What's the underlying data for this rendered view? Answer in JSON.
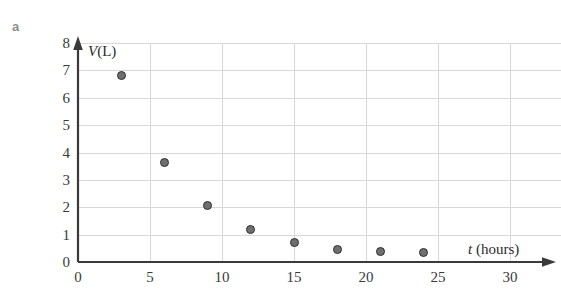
{
  "panel": {
    "label": "a"
  },
  "chart_data": {
    "type": "scatter",
    "title": "",
    "xlabel": "t (hours)",
    "ylabel": "V(L)",
    "xlabel_variable": "t",
    "xlabel_unit": "(hours)",
    "ylabel_variable": "V",
    "ylabel_unit": "(L)",
    "xlim": [
      0,
      30
    ],
    "ylim": [
      0,
      8
    ],
    "xticks": [
      0,
      5,
      10,
      15,
      20,
      25,
      30
    ],
    "xtick_labels": [
      "0",
      "5",
      "10",
      "15",
      "20",
      "25",
      "30"
    ],
    "yticks": [
      0,
      1,
      2,
      3,
      4,
      5,
      6,
      7,
      8
    ],
    "ytick_labels": [
      "0",
      "1",
      "2",
      "3",
      "4",
      "5",
      "6",
      "7",
      "8"
    ],
    "grid": true,
    "grid_x_step": 5,
    "grid_y_step": 1,
    "legend": "none",
    "marker": "filled-circle",
    "marker_color": "#6f6f6f",
    "marker_edge_color": "#2e2e2e",
    "x": [
      3,
      6,
      9,
      12,
      15,
      18,
      21,
      24
    ],
    "y": [
      6.8,
      3.65,
      2.05,
      1.2,
      0.7,
      0.45,
      0.4,
      0.35
    ],
    "points": [
      {
        "t": 3,
        "v": 6.8
      },
      {
        "t": 6,
        "v": 3.65
      },
      {
        "t": 9,
        "v": 2.05
      },
      {
        "t": 12,
        "v": 1.2
      },
      {
        "t": 15,
        "v": 0.7
      },
      {
        "t": 18,
        "v": 0.45
      },
      {
        "t": 21,
        "v": 0.4
      },
      {
        "t": 24,
        "v": 0.35
      }
    ],
    "axis_color": "#3a3a3a",
    "grid_color": "#d8d8d8"
  },
  "notes": {
    "x_last_tick_clipped": "30"
  }
}
